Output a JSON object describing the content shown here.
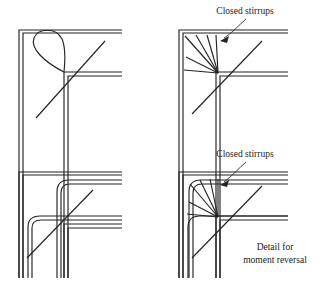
{
  "figure": {
    "background_color": "#ffffff",
    "line_color": "#232323",
    "width": 320,
    "height": 284
  },
  "annotations": {
    "closed_stirrups_top": "Closed stirrups",
    "closed_stirrups_bottom": "Closed stirrups",
    "caption_line1": "Detail for",
    "caption_line2": "moment reversal"
  },
  "panels": [
    {
      "id": "top-left",
      "name": "corner-joint-loop-detail",
      "description": "Corner joint with looped (teardrop) bar anchorage and diagonal bar",
      "features": [
        "outer-bar",
        "inner-bar",
        "loop-anchor",
        "diagonal-bar"
      ],
      "has_label": false,
      "origin_x": 17,
      "origin_y": 29
    },
    {
      "id": "top-right",
      "name": "corner-joint-radial-stirrups-detail",
      "description": "Corner joint with radiating closed stirrups converging at the inner corner",
      "features": [
        "outer-bar",
        "inner-bar",
        "radial-stirrups",
        "diagonal-bar"
      ],
      "has_label": true,
      "stirrup_count": 6,
      "origin_x": 177,
      "origin_y": 29
    },
    {
      "id": "bottom-left",
      "name": "corner-joint-rounded-bars-detail",
      "description": "Corner joint with two nested rounded-corner continuous bars and diagonal bar",
      "features": [
        "outer-rounded-bar",
        "inner-rounded-bar",
        "diagonal-bar"
      ],
      "has_label": false,
      "origin_x": 17,
      "origin_y": 171
    },
    {
      "id": "bottom-right",
      "name": "corner-joint-moment-reversal-detail",
      "description": "Corner joint for moment reversal with rounded bars and radiating closed stirrups",
      "features": [
        "outer-rounded-bar",
        "inner-rounded-bar",
        "radial-stirrups",
        "diagonal-bar"
      ],
      "has_label": true,
      "has_caption": true,
      "stirrup_count": 6,
      "origin_x": 177,
      "origin_y": 171
    }
  ]
}
